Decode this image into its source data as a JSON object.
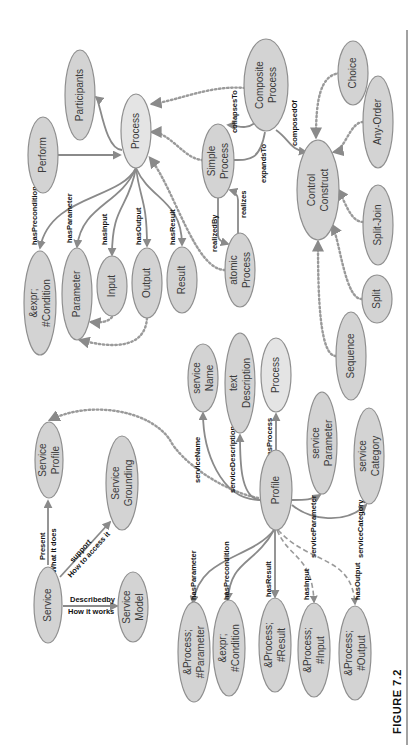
{
  "figure": {
    "caption": "FIGURE 7.2",
    "orientation": "rotated 90° counter-clockwise"
  },
  "colors": {
    "node_fill": "#d3d3d3",
    "node_stroke": "#8f8f8f",
    "edge": "#8a8a8a",
    "text": "#3a3a3a"
  },
  "nodes": {
    "participants": {
      "line1": "Participants",
      "line2": ""
    },
    "perform": {
      "line1": "Perform",
      "line2": ""
    },
    "process_top": {
      "line1": "Process",
      "line2": ""
    },
    "composite_process": {
      "line1": "Composite",
      "line2": "Process"
    },
    "simple_process": {
      "line1": "Simple",
      "line2": "Process"
    },
    "choice": {
      "line1": "Choice",
      "line2": ""
    },
    "any_order": {
      "line1": "Any-Order",
      "line2": ""
    },
    "control_construct": {
      "line1": "Control",
      "line2": "Construct"
    },
    "split_join": {
      "line1": "Split-Join",
      "line2": ""
    },
    "split": {
      "line1": "Split",
      "line2": ""
    },
    "sequence": {
      "line1": "Sequence",
      "line2": ""
    },
    "atomic_process": {
      "line1": "atomic",
      "line2": "Process"
    },
    "expr_condition_top": {
      "line1": "&expr;",
      "line2": "#Condition"
    },
    "parameter": {
      "line1": "Parameter",
      "line2": ""
    },
    "input": {
      "line1": "Input",
      "line2": ""
    },
    "output": {
      "line1": "Output",
      "line2": ""
    },
    "result": {
      "line1": "Result",
      "line2": ""
    },
    "service_name": {
      "line1": "service",
      "line2": "Name"
    },
    "text_description": {
      "line1": "text",
      "line2": "Description"
    },
    "process_bottom": {
      "line1": "Process",
      "line2": ""
    },
    "service_parameter": {
      "line1": "service",
      "line2": "Parameter"
    },
    "service_category": {
      "line1": "service",
      "line2": "Category"
    },
    "profile": {
      "line1": "Profile",
      "line2": ""
    },
    "service_profile": {
      "line1": "Service",
      "line2": "Profile"
    },
    "service_grounding": {
      "line1": "Service",
      "line2": "Grounding"
    },
    "service": {
      "line1": "Service",
      "line2": ""
    },
    "service_model": {
      "line1": "Service",
      "line2": "Model"
    },
    "process_parameter": {
      "line1": "&Process;",
      "line2": "#Parameter"
    },
    "expr_condition_bottom": {
      "line1": "&expr;",
      "line2": "#Condition"
    },
    "process_result": {
      "line1": "&Process;",
      "line2": "#Result"
    },
    "process_input": {
      "line1": "&Process;",
      "line2": "#Input"
    },
    "process_output": {
      "line1": "&Process;",
      "line2": "#Output"
    }
  },
  "edges": {
    "hasPrecondition": "hasPrecondition",
    "hasParameter": "hasParameter",
    "hasInput": "hasInput",
    "hasOutput": "hasOutput",
    "hasResult": "hasResult",
    "collapsesTo": "collapsesTo",
    "expandsTo": "expandsTo",
    "composedOf": "composedOf",
    "realizedBy": "realizedBy",
    "realizes": "realizes",
    "serviceName": "serviceName",
    "serviceDescription": "serviceDescription",
    "hasProcess": "hasProcess",
    "serviceParameter": "serviceParameter",
    "serviceCategory": "serviceCategory",
    "present_l1": "Present",
    "present_l2": "What it does",
    "support_l1": "support",
    "support_l2": "How to access it",
    "describedby_l1": "Describedby",
    "describedby_l2": "How it works",
    "p_hasParameter": "hasParameter",
    "p_hasPrecondition": "hasPrecondition",
    "p_hasResult": "hasResult",
    "p_hasInput": "hasInput",
    "p_hasOutput": "hasOutput"
  }
}
